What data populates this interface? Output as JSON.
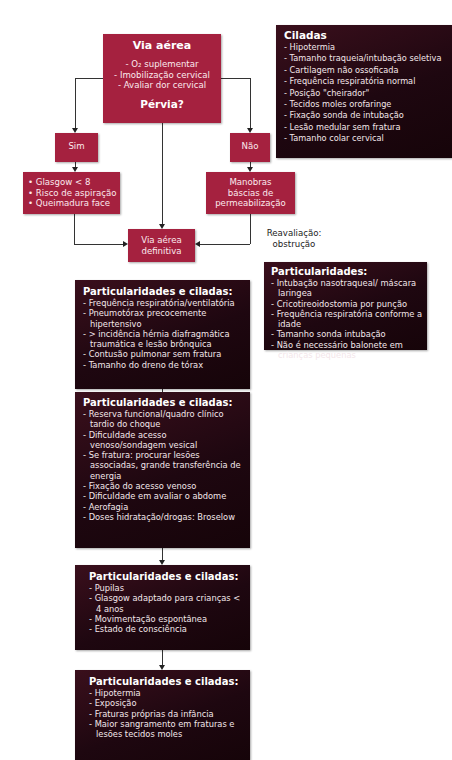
{
  "airway_box": {
    "title": "Via aérea",
    "items": [
      "- O₂ suplementar",
      "- Imobilização cervical",
      "- Avaliar dor cervical"
    ],
    "question": "Pérvia?"
  },
  "pitfalls_box": {
    "title": "Ciladas",
    "items": [
      "- Hipotermia",
      "- Tamanho traqueia/intubação seletiva",
      "- Cartilagem não ossoficada",
      "- Frequência respiratória normal",
      "- Posição \"cheirador\"",
      "- Tecidos moles orofaringe",
      "- Fixação sonda de intubação",
      "- Lesão medular sem fratura",
      "- Tamanho colar cervical"
    ]
  },
  "yes_box": {
    "label": "Sim"
  },
  "no_box": {
    "label": "Não"
  },
  "yes_criteria": {
    "items": [
      "• Glasgow < 8",
      "• Risco de aspiração",
      "• Queimadura face"
    ]
  },
  "no_action": {
    "lines": [
      "Manobras",
      "báscias de",
      "permeabilização"
    ]
  },
  "definitive_airway": {
    "lines": [
      "Via aérea",
      "definitiva"
    ]
  },
  "reassessment": {
    "lines": [
      "Reavaliação:",
      "obstrução"
    ]
  },
  "particularities_box": {
    "title": "Particularidades:",
    "items": [
      "- Intubação nasotraqueal/ máscara laringea",
      "- Cricotireoidostomia por punção",
      "- Frequência respiratória conforme a idade",
      "- Tamanho sonda intubação",
      "- Não é necessário balonete em crianças pequenas"
    ]
  },
  "chain": [
    {
      "title": "Particularidades e ciladas:",
      "items": [
        "- Frequência respiratória/ventilatória",
        "- Pneumotórax precocemente hipertensivo",
        "- > incidência hérnia diafragmática traumática e lesão brônquica",
        "- Contusão pulmonar sem fratura",
        "- Tamanho do dreno de tórax"
      ]
    },
    {
      "title": "Particularidades e ciladas:",
      "items": [
        "- Reserva funcional/quadro clínico tardio do choque",
        "- Dificuldade acesso venoso/sondagem vesical",
        "- Se fratura: procurar lesões associadas, grande transferência de energia",
        "- Fixação do acesso venoso",
        "- Dificuldade em avaliar o abdome",
        "- Aerofagia",
        "- Doses hidratação/drogas: Broselow"
      ]
    },
    {
      "title": "Particularidades e ciladas:",
      "items": [
        "- Pupilas",
        "- Glasgow adaptado para crianças < 4 anos",
        "- Movimentação espontânea",
        "- Estado de consciência"
      ]
    },
    {
      "title": "Particularidades e ciladas:",
      "items": [
        "- Hipotermia",
        "- Exposição",
        "- Fraturas próprias da infância",
        "- Maior sangramento em fraturas e lesões tecidos moles"
      ]
    }
  ],
  "colors": {
    "red_box": "#a5213f",
    "dark_box": "#1e0710",
    "connector": "#333333"
  }
}
